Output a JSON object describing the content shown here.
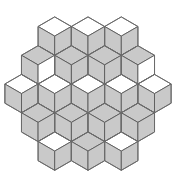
{
  "figure": {
    "type": "geometric-tiling",
    "background_color": "#ffffff",
    "shaded_color": "#c9c9c9",
    "unshaded_color": "#ffffff",
    "edge_color": "#595959",
    "outline_color": "#6b6b6b",
    "canvas": {
      "width": 176,
      "height": 172
    }
  },
  "geometry": {
    "hex_radius": 19.2,
    "hex_flat_to_flat": 33.26,
    "center_x": 88,
    "center_y": 86,
    "cells_total": 19,
    "rhombi_per_cell": 3,
    "rhombi_total": 57,
    "rows": [
      {
        "row": -2,
        "count": 3
      },
      {
        "row": -1,
        "count": 4
      },
      {
        "row": 0,
        "count": 5
      },
      {
        "row": 1,
        "count": 4
      },
      {
        "row": 2,
        "count": 3
      }
    ]
  },
  "chart_data": {
    "type": "table",
    "xlabel": "",
    "ylabel": "",
    "categories": [
      "top-rhombus",
      "left-rhombus",
      "right-rhombus"
    ],
    "series": [
      {
        "name": "shaded-count",
        "values": [
          11,
          19,
          17
        ]
      },
      {
        "name": "unshaded-count",
        "values": [
          8,
          0,
          2
        ]
      }
    ],
    "cells": [
      {
        "id": "r-2c0",
        "q": -1,
        "r": -2,
        "cx": 54.7,
        "cy": 36.1,
        "top": "white",
        "left": "light",
        "right": "light"
      },
      {
        "id": "r-2c1",
        "q": 0,
        "r": -2,
        "cx": 88.0,
        "cy": 36.1,
        "top": "white",
        "left": "light",
        "right": "light"
      },
      {
        "id": "r-2c2",
        "q": 1,
        "r": -2,
        "cx": 121.3,
        "cy": 36.1,
        "top": "white",
        "left": "light",
        "right": "light"
      },
      {
        "id": "r-1c0",
        "q": -2,
        "r": -1,
        "cx": 38.1,
        "cy": 64.9,
        "top": "light",
        "left": "light",
        "right": "white"
      },
      {
        "id": "r-1c1",
        "q": -1,
        "r": -1,
        "cx": 71.4,
        "cy": 64.9,
        "top": "light",
        "left": "light",
        "right": "light"
      },
      {
        "id": "r-1c2",
        "q": 0,
        "r": -1,
        "cx": 104.6,
        "cy": 64.9,
        "top": "light",
        "left": "light",
        "right": "light"
      },
      {
        "id": "r-1c3",
        "q": 1,
        "r": -1,
        "cx": 137.9,
        "cy": 64.9,
        "top": "light",
        "left": "light",
        "right": "white"
      },
      {
        "id": "r0c0",
        "q": -2,
        "r": 0,
        "cx": 21.5,
        "cy": 93.6,
        "top": "white",
        "left": "light",
        "right": "light"
      },
      {
        "id": "r0c1",
        "q": -1,
        "r": 0,
        "cx": 54.7,
        "cy": 93.6,
        "top": "white",
        "left": "light",
        "right": "light"
      },
      {
        "id": "r0c2",
        "q": 0,
        "r": 0,
        "cx": 88.0,
        "cy": 93.6,
        "top": "white",
        "left": "light",
        "right": "light"
      },
      {
        "id": "r0c3",
        "q": 1,
        "r": 0,
        "cx": 121.3,
        "cy": 93.6,
        "top": "white",
        "left": "light",
        "right": "light"
      },
      {
        "id": "r0c4",
        "q": 2,
        "r": 0,
        "cx": 154.5,
        "cy": 93.6,
        "top": "white",
        "left": "light",
        "right": "light"
      },
      {
        "id": "r1c0",
        "q": -2,
        "r": 1,
        "cx": 38.1,
        "cy": 122.4,
        "top": "light",
        "left": "light",
        "right": "light"
      },
      {
        "id": "r1c1",
        "q": -1,
        "r": 1,
        "cx": 71.4,
        "cy": 122.4,
        "top": "light",
        "left": "light",
        "right": "light"
      },
      {
        "id": "r1c2",
        "q": 0,
        "r": 1,
        "cx": 104.6,
        "cy": 122.4,
        "top": "light",
        "left": "light",
        "right": "light"
      },
      {
        "id": "r1c3",
        "q": 1,
        "r": 1,
        "cx": 137.9,
        "cy": 122.4,
        "top": "light",
        "left": "light",
        "right": "light"
      },
      {
        "id": "r2c0",
        "q": -1,
        "r": 2,
        "cx": 54.7,
        "cy": 151.1,
        "top": "white",
        "left": "light",
        "right": "light"
      },
      {
        "id": "r2c1",
        "q": 0,
        "r": 2,
        "cx": 88.0,
        "cy": 151.1,
        "top": "light",
        "left": "light",
        "right": "light"
      },
      {
        "id": "r2c2",
        "q": 1,
        "r": 2,
        "cx": 121.3,
        "cy": 151.1,
        "top": "white",
        "left": "light",
        "right": "light"
      }
    ]
  }
}
